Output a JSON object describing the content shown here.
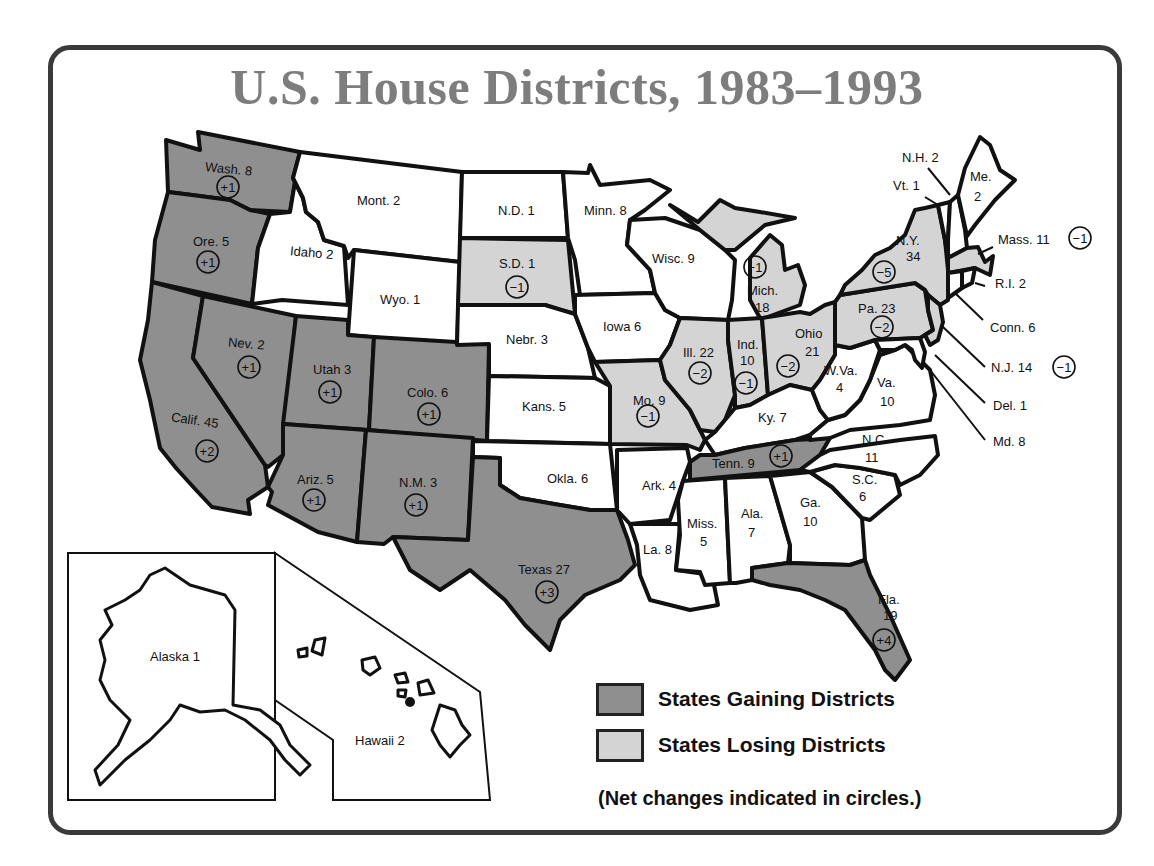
{
  "title": "U.S. House Districts, 1983–1993",
  "colors": {
    "gain": "#8f8f8f",
    "lose": "#d4d4d4",
    "none": "#ffffff",
    "title": "#7d7d7d",
    "border": "#3a3a3a"
  },
  "legend": {
    "gain_label": "States Gaining Districts",
    "lose_label": "States Losing Districts",
    "note": "(Net changes indicated in circles.)"
  },
  "states": {
    "wash": {
      "label": "Wash. 8",
      "change": "+1",
      "status": "gain"
    },
    "ore": {
      "label": "Ore. 5",
      "change": "+1",
      "status": "gain"
    },
    "calif": {
      "label": "Calif. 45",
      "change": "+2",
      "status": "gain"
    },
    "idaho": {
      "label": "Idaho 2",
      "status": "none"
    },
    "nev": {
      "label": "Nev. 2",
      "change": "+1",
      "status": "gain"
    },
    "mont": {
      "label": "Mont. 2",
      "status": "none"
    },
    "wyo": {
      "label": "Wyo. 1",
      "status": "none"
    },
    "utah": {
      "label": "Utah 3",
      "change": "+1",
      "status": "gain"
    },
    "colo": {
      "label": "Colo. 6",
      "change": "+1",
      "status": "gain"
    },
    "ariz": {
      "label": "Ariz. 5",
      "change": "+1",
      "status": "gain"
    },
    "nm": {
      "label": "N.M. 3",
      "change": "+1",
      "status": "gain"
    },
    "nd": {
      "label": "N.D. 1",
      "status": "none"
    },
    "sd": {
      "label": "S.D. 1",
      "change": "−1",
      "status": "lose"
    },
    "nebr": {
      "label": "Nebr. 3",
      "status": "none"
    },
    "kans": {
      "label": "Kans. 5",
      "status": "none"
    },
    "okla": {
      "label": "Okla. 6",
      "status": "none"
    },
    "texas": {
      "label": "Texas 27",
      "change": "+3",
      "status": "gain"
    },
    "minn": {
      "label": "Minn. 8",
      "status": "none"
    },
    "iowa": {
      "label": "Iowa 6",
      "status": "none"
    },
    "mo": {
      "label": "Mo. 9",
      "change": "−1",
      "status": "lose"
    },
    "ark": {
      "label": "Ark. 4",
      "status": "none"
    },
    "la": {
      "label": "La. 8",
      "status": "none"
    },
    "wisc": {
      "label": "Wisc. 9",
      "status": "none"
    },
    "ill": {
      "label": "Ill. 22",
      "change": "−2",
      "status": "lose"
    },
    "mich": {
      "label_1": "Mich.",
      "label_2": "18",
      "change": "−1",
      "status": "lose"
    },
    "ind": {
      "label_1": "Ind.",
      "label_2": "10",
      "change": "−1",
      "status": "lose"
    },
    "ohio": {
      "label_1": "Ohio",
      "label_2": "21",
      "change": "−2",
      "status": "lose"
    },
    "ky": {
      "label": "Ky. 7",
      "status": "none"
    },
    "tenn": {
      "label": "Tenn. 9",
      "change": "+1",
      "status": "gain"
    },
    "miss": {
      "label_1": "Miss.",
      "label_2": "5",
      "status": "none"
    },
    "ala": {
      "label_1": "Ala.",
      "label_2": "7",
      "status": "none"
    },
    "ga": {
      "label_1": "Ga.",
      "label_2": "10",
      "status": "none"
    },
    "fla": {
      "label_1": "Fla.",
      "label_2": "19",
      "change": "+4",
      "status": "gain"
    },
    "sc": {
      "label_1": "S.C.",
      "label_2": "6",
      "status": "none"
    },
    "nc": {
      "label_1": "N.C.",
      "label_2": "11",
      "status": "none"
    },
    "va": {
      "label_1": "Va.",
      "label_2": "10",
      "status": "none"
    },
    "wva": {
      "label_1": "W.Va.",
      "label_2": "4",
      "status": "none"
    },
    "pa": {
      "label": "Pa. 23",
      "change": "−2",
      "status": "lose"
    },
    "ny": {
      "label_1": "N.Y.",
      "label_2": "34",
      "change": "−5",
      "status": "lose"
    },
    "vt": {
      "label": "Vt. 1",
      "status": "none"
    },
    "nh": {
      "label": "N.H. 2",
      "status": "none"
    },
    "me": {
      "label_1": "Me.",
      "label_2": "2",
      "status": "none"
    },
    "mass": {
      "label": "Mass. 11",
      "change": "−1",
      "status": "lose"
    },
    "ri": {
      "label": "R.I. 2",
      "status": "none"
    },
    "conn": {
      "label": "Conn. 6",
      "status": "none"
    },
    "nj": {
      "label": "N.J. 14",
      "change": "−1",
      "status": "lose"
    },
    "del": {
      "label": "Del. 1",
      "status": "none"
    },
    "md": {
      "label": "Md. 8",
      "status": "none"
    },
    "alaska": {
      "label": "Alaska 1",
      "status": "none"
    },
    "hawaii": {
      "label": "Hawaii 2",
      "status": "none"
    }
  }
}
